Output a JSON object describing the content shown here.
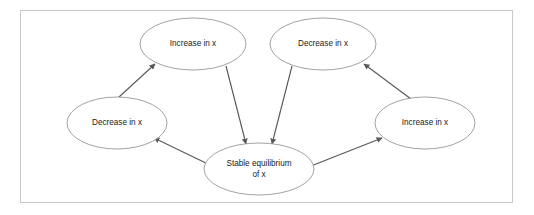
{
  "diagram": {
    "type": "node-edge-cycle-diagram",
    "frame": {
      "border_color": "#c9c9c9",
      "background_color": "#ffffff"
    },
    "style": {
      "node_fill": "#ffffff",
      "node_stroke": "#8a8a8a",
      "edge_color": "#595959",
      "text_color": "#1a1a1a"
    },
    "nodes": [
      {
        "id": "increase-top-left",
        "label_line1": "Increase in x",
        "label_line2": "",
        "cx": 193,
        "cy": 44,
        "rx": 53,
        "ry": 26
      },
      {
        "id": "decrease-top-right",
        "label_line1": "Decrease in x",
        "label_line2": "",
        "cx": 323,
        "cy": 44,
        "rx": 53,
        "ry": 26
      },
      {
        "id": "decrease-left",
        "label_line1": "Decrease in x",
        "label_line2": "",
        "cx": 117,
        "cy": 123,
        "rx": 50,
        "ry": 26
      },
      {
        "id": "increase-right",
        "label_line1": "Increase in x",
        "label_line2": "",
        "cx": 425,
        "cy": 123,
        "rx": 50,
        "ry": 26
      },
      {
        "id": "stable-equilibrium",
        "label_line1": "Stable equilibrium",
        "label_line2": "of x",
        "cx": 259,
        "cy": 169,
        "rx": 55,
        "ry": 26
      }
    ],
    "edges": [
      {
        "id": "edge-decrease-left-to-increase-top-left",
        "from": "decrease-left",
        "to": "increase-top-left",
        "x1": 119,
        "y1": 97,
        "x2": 155,
        "y2": 64,
        "arrowhead": "end"
      },
      {
        "id": "edge-increase-top-left-to-stable",
        "from": "increase-top-left",
        "to": "stable-equilibrium",
        "x1": 226,
        "y1": 66,
        "x2": 246,
        "y2": 144,
        "arrowhead": "end"
      },
      {
        "id": "edge-decrease-top-right-to-stable",
        "from": "decrease-top-right",
        "to": "stable-equilibrium",
        "x1": 292,
        "y1": 66,
        "x2": 272,
        "y2": 144,
        "arrowhead": "end"
      },
      {
        "id": "edge-increase-right-to-decrease-top-right",
        "from": "increase-right",
        "to": "decrease-top-right",
        "x1": 411,
        "y1": 99,
        "x2": 364,
        "y2": 64,
        "arrowhead": "end"
      },
      {
        "id": "edge-stable-to-decrease-left",
        "from": "stable-equilibrium",
        "to": "decrease-left",
        "x1": 210,
        "y1": 165,
        "x2": 154,
        "y2": 138,
        "arrowhead": "end"
      },
      {
        "id": "edge-stable-to-increase-right",
        "from": "stable-equilibrium",
        "to": "increase-right",
        "x1": 311,
        "y1": 166,
        "x2": 382,
        "y2": 138,
        "arrowhead": "end"
      }
    ]
  }
}
